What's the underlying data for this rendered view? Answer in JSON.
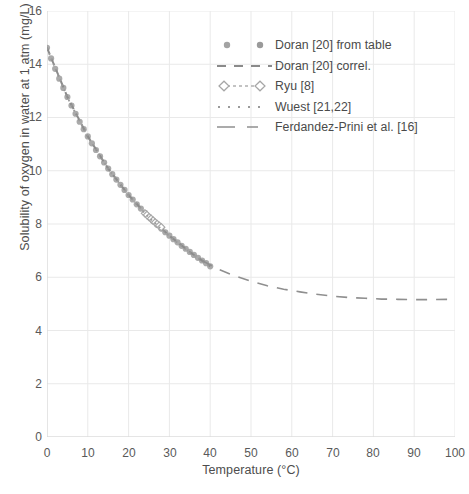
{
  "chart_data": {
    "type": "scatter",
    "title": "",
    "xlabel": "Temperature (°C)",
    "ylabel": "Solubility of oxygen in water at 1 atm (mg/L)",
    "xlim": [
      0,
      100
    ],
    "ylim": [
      0,
      16
    ],
    "xticks": [
      0,
      10,
      20,
      30,
      40,
      50,
      60,
      70,
      80,
      90,
      100
    ],
    "yticks": [
      0,
      2,
      4,
      6,
      8,
      10,
      12,
      14,
      16
    ],
    "grid": true,
    "legend_position": "upper right",
    "series": [
      {
        "name": "Doran [20] from table",
        "marker": "filled-circle",
        "linestyle": "none",
        "color": "#9b9b9b",
        "x": [
          0,
          1,
          2,
          3,
          4,
          5,
          6,
          7,
          8,
          9,
          10,
          11,
          12,
          13,
          14,
          15,
          16,
          17,
          18,
          19,
          20,
          21,
          22,
          23,
          24,
          25,
          26,
          27,
          28,
          29,
          30,
          31,
          32,
          33,
          34,
          35,
          36,
          37,
          38,
          39,
          40
        ],
        "y": [
          14.62,
          14.22,
          13.83,
          13.46,
          13.11,
          12.77,
          12.45,
          12.14,
          11.84,
          11.56,
          11.29,
          11.03,
          10.78,
          10.54,
          10.31,
          10.08,
          9.87,
          9.67,
          9.47,
          9.28,
          9.09,
          8.92,
          8.74,
          8.58,
          8.42,
          8.26,
          8.11,
          7.97,
          7.83,
          7.69,
          7.56,
          7.43,
          7.31,
          7.18,
          7.07,
          6.95,
          6.84,
          6.73,
          6.63,
          6.53,
          6.41
        ]
      },
      {
        "name": "Doran [20] correl.",
        "marker": "none",
        "linestyle": "dashed",
        "color": "#8c8c8c",
        "x": [
          0,
          5,
          10,
          15,
          20,
          25,
          30,
          35,
          40
        ],
        "y": [
          14.62,
          12.77,
          11.29,
          10.08,
          9.09,
          8.26,
          7.56,
          6.95,
          6.41
        ]
      },
      {
        "name": "Ryu [8]",
        "marker": "open-diamond",
        "linestyle": "dash-dot",
        "color": "#a8a8a8",
        "x": [
          24.0,
          24.5,
          25.0,
          25.5,
          26.0,
          26.5,
          27.0,
          27.5,
          28.0
        ],
        "y": [
          8.4,
          8.34,
          8.26,
          8.2,
          8.13,
          8.06,
          8.0,
          7.94,
          7.88
        ]
      },
      {
        "name": "Wuest [21,22]",
        "marker": "none",
        "linestyle": "dotted",
        "color": "#9a9a9a",
        "x": [
          0,
          5,
          10,
          15,
          20,
          25,
          30,
          35,
          40
        ],
        "y": [
          14.6,
          12.75,
          11.28,
          10.07,
          9.08,
          8.24,
          7.54,
          6.93,
          6.41
        ]
      },
      {
        "name": "Ferdandez-Prini et al. [16]",
        "marker": "none",
        "linestyle": "long-dash",
        "color": "#8f8f8f",
        "x": [
          38,
          42,
          46,
          50,
          54,
          58,
          62,
          66,
          70,
          74,
          78,
          82,
          86,
          90,
          94,
          98,
          100
        ],
        "y": [
          6.63,
          6.3,
          6.05,
          5.85,
          5.68,
          5.55,
          5.45,
          5.36,
          5.29,
          5.24,
          5.21,
          5.18,
          5.17,
          5.16,
          5.16,
          5.17,
          5.18
        ]
      }
    ]
  },
  "axes": {
    "xlabel": "Temperature (°C)",
    "ylabel": "Solubility of oxygen in water at 1 atm (mg/L)",
    "xticks": [
      "0",
      "10",
      "20",
      "30",
      "40",
      "50",
      "60",
      "70",
      "80",
      "90",
      "100"
    ],
    "yticks": [
      "16",
      "14",
      "12",
      "10",
      "8",
      "6",
      "4",
      "2",
      "0"
    ]
  },
  "legend": {
    "entries": [
      {
        "label": "Doran [20] from table"
      },
      {
        "label": "Doran [20] correl."
      },
      {
        "label": "Ryu [8]"
      },
      {
        "label": "Wuest [21,22]"
      },
      {
        "label": "Ferdandez-Prini et al. [16]"
      }
    ]
  },
  "colors": {
    "marker_gray": "#9b9b9b",
    "line_gray": "#8c8c8c",
    "grid_gray": "#e9e9e9",
    "text_gray": "#4d4d4d"
  }
}
